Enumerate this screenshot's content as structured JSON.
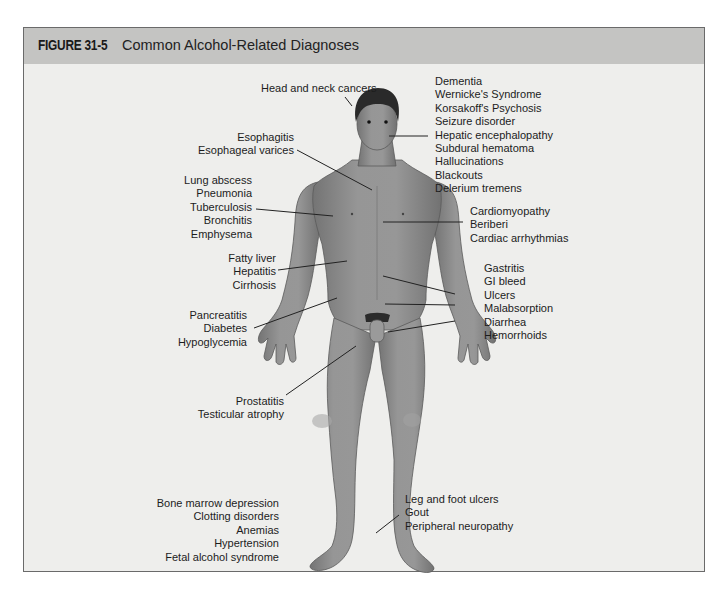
{
  "figure": {
    "number": "FIGURE 31-5",
    "title": "Common Alcohol-Related Diagnoses"
  },
  "labels": {
    "head_neck": [
      "Head and neck cancers"
    ],
    "brain": [
      "Dementia",
      "Wernicke's Syndrome",
      "Korsakoff's Psychosis",
      "Seizure disorder",
      "Hepatic encephalopathy",
      "Subdural hematoma",
      "Hallucinations",
      "Blackouts",
      "Delerium tremens"
    ],
    "esophagus": [
      "Esophagitis",
      "Esophageal varices"
    ],
    "lungs": [
      "Lung abscess",
      "Pneumonia",
      "Tuberculosis",
      "Bronchitis",
      "Emphysema"
    ],
    "heart": [
      "Cardiomyopathy",
      "Beriberi",
      "Cardiac arrhythmias"
    ],
    "liver": [
      "Fatty liver",
      "Hepatitis",
      "Cirrhosis"
    ],
    "gi": [
      "Gastritis",
      "GI bleed",
      "Ulcers",
      "Malabsorption",
      "Diarrhea",
      "Hemorrhoids"
    ],
    "pancreas": [
      "Pancreatitis",
      "Diabetes",
      "Hypoglycemia"
    ],
    "reproductive": [
      "Prostatitis",
      "Testicular atrophy"
    ],
    "blood": [
      "Bone marrow depression",
      "Clotting disorders",
      "Anemias",
      "Hypertension",
      "Fetal alcohol syndrome"
    ],
    "legs": [
      "Leg and foot ulcers",
      "Gout",
      "Peripheral neuropathy"
    ]
  },
  "colors": {
    "header_bg": "#c4c4c2",
    "panel_bg": "#eeeeec",
    "skin": "#8c8c8c",
    "hair": "#2a2a2a",
    "leader_line": "#222222"
  }
}
